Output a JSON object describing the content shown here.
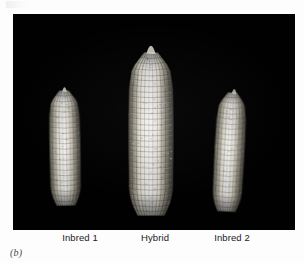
{
  "figure": {
    "caption": "(b)",
    "plate": {
      "background_color": "#010101",
      "page_color": "#fdfdfd"
    },
    "specimens": [
      {
        "id": "inbred-1",
        "label": "Inbred 1",
        "label_center_x": 80,
        "kernel_color": "#d9d4c8",
        "rows": 9,
        "kernel_rows": 22,
        "geometry": {
          "x": 49,
          "y": 90,
          "width": 32,
          "height": 116,
          "tilt_deg": -1
        }
      },
      {
        "id": "hybrid",
        "label": "Hybrid",
        "label_center_x": 155,
        "kernel_color": "#e4e0d4",
        "rows": 11,
        "kernel_rows": 30,
        "geometry": {
          "x": 128,
          "y": 52,
          "width": 46,
          "height": 164,
          "tilt_deg": 0
        }
      },
      {
        "id": "inbred-2",
        "label": "Inbred 2",
        "label_center_x": 232,
        "kernel_color": "#d5d0c3",
        "rows": 9,
        "kernel_rows": 23,
        "geometry": {
          "x": 214,
          "y": 92,
          "width": 31,
          "height": 120,
          "tilt_deg": 3
        }
      }
    ]
  }
}
